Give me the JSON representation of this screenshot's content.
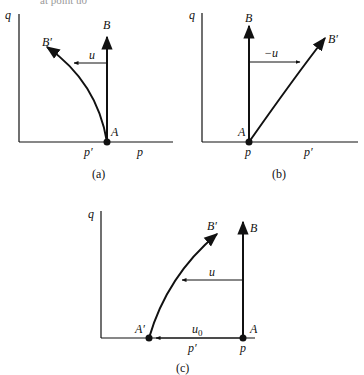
{
  "header_fragment": "at point u0",
  "panels": [
    {
      "id": "a",
      "caption": "(a)",
      "axis_y": "q",
      "labels": {
        "B": "B",
        "Bp": "B′",
        "u": "u",
        "A": "A",
        "pprime": "p′",
        "p": "p"
      }
    },
    {
      "id": "b",
      "caption": "(b)",
      "axis_y": "q",
      "labels": {
        "B": "B",
        "Bp": "B′",
        "u": "−u",
        "A": "A",
        "p": "p",
        "pprime": "p′"
      }
    },
    {
      "id": "c",
      "caption": "(c)",
      "axis_y": "q",
      "labels": {
        "B": "B",
        "Bp": "B′",
        "u": "u",
        "u0": "u",
        "u0sub": "0",
        "A": "A",
        "Ap": "A′",
        "pprime": "p′",
        "p": "p"
      }
    }
  ]
}
